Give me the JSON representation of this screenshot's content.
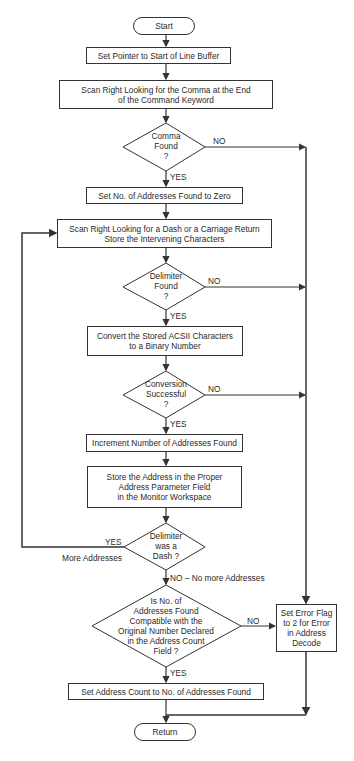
{
  "flowchart": {
    "start": "Start",
    "set_pointer": "Set Pointer to Start of Line Buffer",
    "scan_comma": "Scan Right Looking for the Comma at the End\nof the Command Keyword",
    "comma_found": "Comma\nFound\n?",
    "set_zero": "Set No. of Addresses Found to Zero",
    "scan_dash": "Scan Right Looking for a Dash or a Carriage Return\nStore the Intervening Characters",
    "delimiter_found": "Delimiter\nFound\n?",
    "convert": "Convert the Stored ACSII Characters\nto a Binary Number",
    "conversion_ok": "Conversion\nSuccessful\n?",
    "increment": "Increment Number of Addresses Found",
    "store_address": "Store the Address in the Proper\nAddress Parameter Field\nin the Monitor Workspace",
    "was_dash": "Delimiter\nwas a\nDash ?",
    "compatible": "Is No. of\nAddresses Found\nCompatible with the\nOriginal Number Declared\nin the Address Count\nField ?",
    "set_error": "Set Error Flag\nto 2 for Error\nin Address\nDecode",
    "set_count": "Set Address Count to No. of Addresses Found",
    "return": "Return"
  },
  "labels": {
    "yes": "YES",
    "no": "NO",
    "more_addresses": "More Addresses",
    "no_more": "NO – No more Addresses"
  }
}
